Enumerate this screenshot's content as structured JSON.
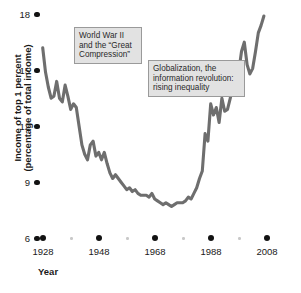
{
  "chart_data": {
    "type": "line",
    "title": "",
    "xlabel": "Year",
    "ylabel": "Income of top 1 percent (percentage of total income)",
    "ylabel_line1": "Income of top 1 percent",
    "ylabel_line2": "(percentage of total income)",
    "xlim": [
      1928,
      2008
    ],
    "ylim": [
      6,
      18
    ],
    "grid": false,
    "legend": "none",
    "line_color": "#6e6e6e",
    "yticks": [
      18,
      15,
      12,
      9,
      6
    ],
    "ytick_labels": [
      "18",
      "15",
      "12",
      "9",
      "6"
    ],
    "xticks": [
      1928,
      1948,
      1968,
      1988,
      2008
    ],
    "xtick_labels": [
      "1928",
      "1948",
      "1968",
      "1988",
      "2008"
    ],
    "xticks_minor": [
      1938,
      1958,
      1978,
      1998
    ],
    "series": [
      {
        "name": "Income share of top 1 percent",
        "x": [
          1928,
          1929,
          1930,
          1931,
          1932,
          1933,
          1934,
          1935,
          1936,
          1937,
          1938,
          1939,
          1940,
          1941,
          1942,
          1943,
          1944,
          1945,
          1946,
          1947,
          1948,
          1949,
          1950,
          1951,
          1952,
          1953,
          1954,
          1955,
          1956,
          1957,
          1958,
          1959,
          1960,
          1961,
          1962,
          1963,
          1964,
          1965,
          1966,
          1967,
          1968,
          1969,
          1970,
          1971,
          1972,
          1973,
          1974,
          1975,
          1976,
          1977,
          1978,
          1979,
          1980,
          1981,
          1982,
          1983,
          1984,
          1985,
          1986,
          1987,
          1988,
          1989,
          1990,
          1991,
          1992,
          1993,
          1994,
          1995,
          1996,
          1997,
          1998,
          1999,
          2000,
          2001,
          2002,
          2003,
          2004,
          2005,
          2006,
          2007
        ],
        "values": [
          16.2,
          14.9,
          14.1,
          13.5,
          13.6,
          14.4,
          13.5,
          13.3,
          14.2,
          13.6,
          12.9,
          13.2,
          13.0,
          12.0,
          11.0,
          10.5,
          10.2,
          11.0,
          11.2,
          10.4,
          10.6,
          10.2,
          10.6,
          10.0,
          9.5,
          9.2,
          9.4,
          9.2,
          9.0,
          8.8,
          8.6,
          8.7,
          8.5,
          8.6,
          8.4,
          8.3,
          8.3,
          8.3,
          8.2,
          8.4,
          8.1,
          8.0,
          7.9,
          7.8,
          7.9,
          7.8,
          7.7,
          7.8,
          7.9,
          7.9,
          7.9,
          8.0,
          8.2,
          8.1,
          8.4,
          8.7,
          9.2,
          9.6,
          11.6,
          11.2,
          13.2,
          12.6,
          13.0,
          12.2,
          13.5,
          12.8,
          12.9,
          13.5,
          14.2,
          14.7,
          14.9,
          16.0,
          16.5,
          15.3,
          14.8,
          15.1,
          16.0,
          17.0,
          17.4,
          17.9
        ]
      }
    ],
    "annotations": [
      {
        "id": "ww2-note",
        "line1": "World War II",
        "line2": "and the “Great",
        "line3": "Compression”"
      },
      {
        "id": "globalization-note",
        "line1": "Globalization, the",
        "line2": "information revolution:",
        "line3": "rising inequality"
      }
    ]
  }
}
